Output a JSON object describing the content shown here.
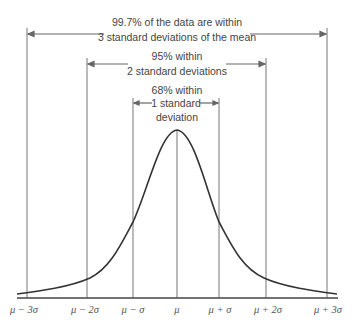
{
  "diagram": {
    "type": "normal-distribution-empirical-rule",
    "colors": {
      "line": "#666666",
      "curve": "#333333",
      "text": "#444444",
      "background": "#ffffff"
    },
    "ranges": [
      {
        "id": "three_sigma",
        "line1": "99.7% of the data are within",
        "line2": "3 standard deviations of the mean",
        "line3": ""
      },
      {
        "id": "two_sigma",
        "line1": "95% within",
        "line2": "2 standard deviations",
        "line3": ""
      },
      {
        "id": "one_sigma",
        "line1": "68% within",
        "line2": "1 standard",
        "line3": "deviation"
      }
    ],
    "axis_labels": [
      "μ − 3σ",
      "μ − 2σ",
      "μ − σ",
      "μ",
      "μ + σ",
      "μ + 2σ",
      "μ + 3σ"
    ]
  }
}
